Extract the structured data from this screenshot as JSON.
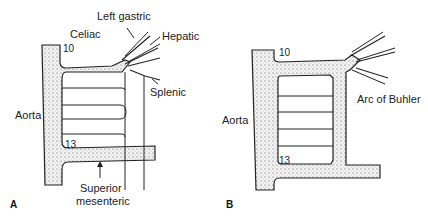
{
  "panelA": {
    "letter": "A",
    "labels": {
      "aorta": "Aorta",
      "celiac": "Celiac",
      "left_gastric": "Left gastric",
      "hepatic": "Hepatic",
      "splenic": "Splenic",
      "superior_line1": "Superior",
      "superior_line2": "mesenteric",
      "level_top": "10",
      "level_bottom": "13"
    }
  },
  "panelB": {
    "letter": "B",
    "labels": {
      "aorta": "Aorta",
      "arc": "Arc of Buhler",
      "level_top": "10",
      "level_bottom": "13"
    }
  },
  "colors": {
    "stroke": "#222222",
    "stipple": "#e6e6e6"
  }
}
